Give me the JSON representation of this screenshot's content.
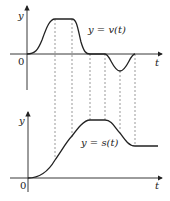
{
  "top_graph": {
    "y_axis_label": "y",
    "t_axis_label": "t",
    "origin_label": "0",
    "curve_label": "y = v(t)"
  },
  "bottom_graph": {
    "y_axis_label": "y",
    "t_axis_label": "t",
    "origin_label": "0",
    "curve_label": "y = s(t)"
  },
  "colors": {
    "curve": "#222222",
    "axes": "#222222",
    "dashed": "#555555"
  }
}
